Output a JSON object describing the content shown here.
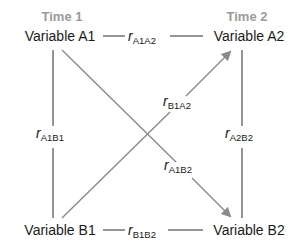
{
  "diagram": {
    "time_labels": {
      "time1": "Time 1",
      "time2": "Time 2"
    },
    "variables": {
      "a1": "Variable A1",
      "a2": "Variable A2",
      "b1": "Variable B1",
      "b2": "Variable B2"
    },
    "correlations": {
      "a1a2": {
        "symbol": "r",
        "subscript": "A1A2"
      },
      "b1b2": {
        "symbol": "r",
        "subscript": "B1B2"
      },
      "a1b1": {
        "symbol": "r",
        "subscript": "A1B1"
      },
      "a2b2": {
        "symbol": "r",
        "subscript": "A2B2"
      },
      "b1a2": {
        "symbol": "r",
        "subscript": "B1A2"
      },
      "a1b2": {
        "symbol": "r",
        "subscript": "A1B2"
      }
    },
    "colors": {
      "text": "#1a1a1a",
      "time_label": "#9a9a9a",
      "line": "#2a2a2a",
      "cross_arrow": "#8a8a8a"
    }
  }
}
